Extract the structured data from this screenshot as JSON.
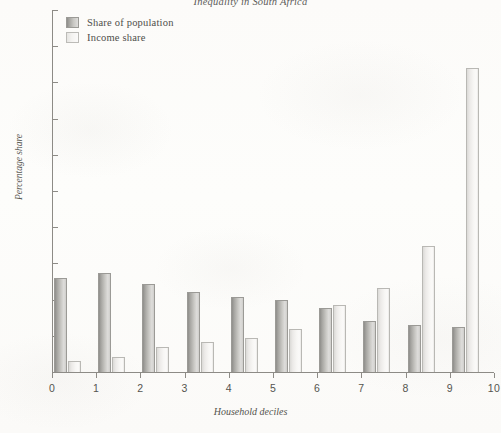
{
  "chart_data": {
    "type": "bar",
    "title": "Inequality in South Africa",
    "xlabel": "Household deciles",
    "ylabel": "Percentage share",
    "categories": [
      "0",
      "1",
      "2",
      "3",
      "4",
      "5",
      "6",
      "7",
      "8",
      "9"
    ],
    "xlim": [
      0,
      10
    ],
    "ylim": [
      0,
      50
    ],
    "x_ticks": [
      "0",
      "1",
      "2",
      "3",
      "4",
      "5",
      "6",
      "7",
      "8",
      "9",
      "10"
    ],
    "y_ticks": [
      "0",
      "5",
      "10",
      "15",
      "20",
      "25",
      "30",
      "35",
      "40",
      "45",
      "50"
    ],
    "grid": false,
    "legend_position": "top-left",
    "series": [
      {
        "name": "Share of population",
        "color": "#b4b3af",
        "values": [
          13.0,
          13.7,
          12.1,
          11.1,
          10.4,
          9.9,
          8.9,
          7.0,
          6.5,
          6.2
        ]
      },
      {
        "name": "Income share",
        "color": "#f0efed",
        "values": [
          1.5,
          2.1,
          3.5,
          4.2,
          4.7,
          6.0,
          9.2,
          11.6,
          17.4,
          42.0
        ]
      }
    ]
  }
}
